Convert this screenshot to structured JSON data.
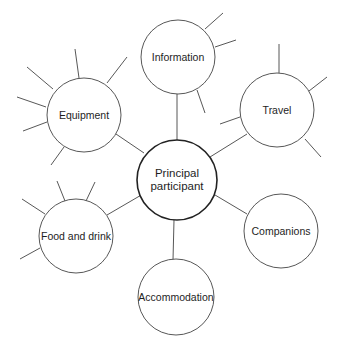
{
  "diagram": {
    "type": "mind-map",
    "center": {
      "id": "principal",
      "label": "Principal\nparticipant",
      "cx": 177,
      "cy": 180,
      "r": 40
    },
    "nodes": [
      {
        "id": "information",
        "label": "Information",
        "cx": 178,
        "cy": 57,
        "r": 37
      },
      {
        "id": "equipment",
        "label": "Equipment",
        "cx": 84,
        "cy": 115,
        "r": 37
      },
      {
        "id": "travel",
        "label": "Travel",
        "cx": 277,
        "cy": 110,
        "r": 37
      },
      {
        "id": "food-and-drink",
        "label": "Food and drink",
        "cx": 76,
        "cy": 236,
        "r": 37
      },
      {
        "id": "companions",
        "label": "Companions",
        "cx": 281,
        "cy": 231,
        "r": 37
      },
      {
        "id": "accommodation",
        "label": "Accommodation",
        "cx": 176,
        "cy": 297,
        "r": 38
      }
    ],
    "connectors": [
      {
        "from": "principal",
        "to": "information",
        "x1": 177,
        "y1": 140,
        "x2": 177,
        "y2": 94
      },
      {
        "from": "principal",
        "to": "equipment",
        "x1": 144,
        "y1": 153,
        "x2": 116,
        "y2": 134
      },
      {
        "from": "principal",
        "to": "travel",
        "x1": 210,
        "y1": 157,
        "x2": 247,
        "y2": 134
      },
      {
        "from": "principal",
        "to": "food-and-drink",
        "x1": 143,
        "y1": 194,
        "x2": 107,
        "y2": 215
      },
      {
        "from": "principal",
        "to": "companions",
        "x1": 210,
        "y1": 192,
        "x2": 247,
        "y2": 214
      },
      {
        "from": "principal",
        "to": "accommodation",
        "x1": 174,
        "y1": 220,
        "x2": 173,
        "y2": 260
      }
    ],
    "spokes": [
      {
        "node": "information",
        "x1": 205,
        "y1": 29,
        "x2": 223,
        "y2": 13
      },
      {
        "node": "information",
        "x1": 215,
        "y1": 47,
        "x2": 236,
        "y2": 40
      },
      {
        "node": "information",
        "x1": 197,
        "y1": 90,
        "x2": 205,
        "y2": 113
      },
      {
        "node": "equipment",
        "x1": 79,
        "y1": 78,
        "x2": 75,
        "y2": 49
      },
      {
        "node": "equipment",
        "x1": 107,
        "y1": 83,
        "x2": 127,
        "y2": 57
      },
      {
        "node": "equipment",
        "x1": 53,
        "y1": 89,
        "x2": 27,
        "y2": 67
      },
      {
        "node": "equipment",
        "x1": 46,
        "y1": 107,
        "x2": 17,
        "y2": 97
      },
      {
        "node": "equipment",
        "x1": 47,
        "y1": 122,
        "x2": 23,
        "y2": 131
      },
      {
        "node": "equipment",
        "x1": 64,
        "y1": 147,
        "x2": 51,
        "y2": 165
      },
      {
        "node": "travel",
        "x1": 279,
        "y1": 73,
        "x2": 279,
        "y2": 44
      },
      {
        "node": "travel",
        "x1": 309,
        "y1": 91,
        "x2": 327,
        "y2": 77
      },
      {
        "node": "travel",
        "x1": 305,
        "y1": 139,
        "x2": 321,
        "y2": 157
      },
      {
        "node": "travel",
        "x1": 240,
        "y1": 117,
        "x2": 220,
        "y2": 124
      },
      {
        "node": "food-and-drink",
        "x1": 65,
        "y1": 201,
        "x2": 57,
        "y2": 181
      },
      {
        "node": "food-and-drink",
        "x1": 86,
        "y1": 201,
        "x2": 95,
        "y2": 182
      },
      {
        "node": "food-and-drink",
        "x1": 45,
        "y1": 214,
        "x2": 22,
        "y2": 199
      },
      {
        "node": "food-and-drink",
        "x1": 40,
        "y1": 248,
        "x2": 20,
        "y2": 259
      }
    ],
    "colors": {
      "stroke": "#444444",
      "principal_stroke": "#222222",
      "text": "#1e1e1e",
      "background": "#ffffff"
    }
  }
}
